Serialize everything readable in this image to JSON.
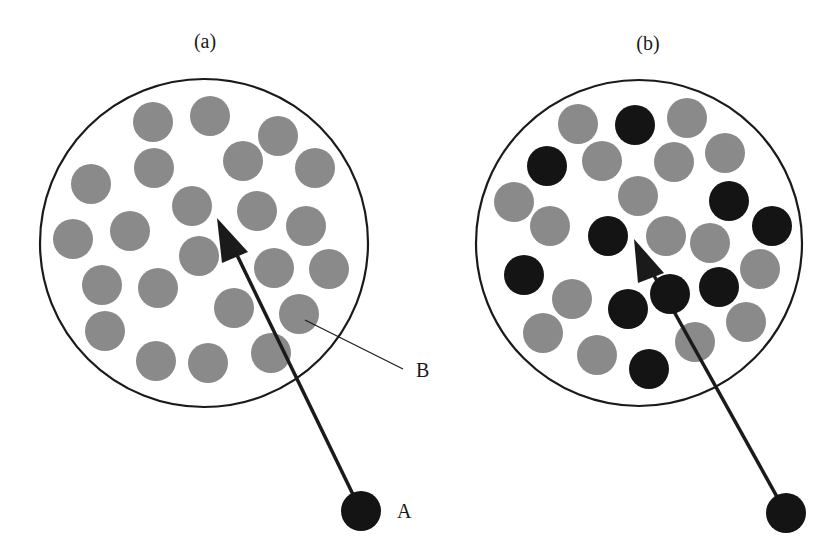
{
  "colors": {
    "background": "#ffffff",
    "outline": "#1a1a1a",
    "gray_particle": "#8a8a8a",
    "black_particle": "#141414",
    "arrow": "#1a1a1a"
  },
  "panels": [
    {
      "id": "a",
      "label": "(a)",
      "label_pos": [
        205,
        48
      ],
      "container": {
        "cx": 204,
        "cy": 243,
        "r": 164
      },
      "particle_radius": 20,
      "particles": [
        {
          "x": 153,
          "y": 122,
          "type": "gray"
        },
        {
          "x": 210,
          "y": 116,
          "type": "gray"
        },
        {
          "x": 278,
          "y": 136,
          "type": "gray"
        },
        {
          "x": 243,
          "y": 161,
          "type": "gray"
        },
        {
          "x": 315,
          "y": 168,
          "type": "gray"
        },
        {
          "x": 154,
          "y": 168,
          "type": "gray"
        },
        {
          "x": 91,
          "y": 184,
          "type": "gray"
        },
        {
          "x": 192,
          "y": 206,
          "type": "gray"
        },
        {
          "x": 257,
          "y": 211,
          "type": "gray"
        },
        {
          "x": 306,
          "y": 226,
          "type": "gray"
        },
        {
          "x": 73,
          "y": 239,
          "type": "gray"
        },
        {
          "x": 130,
          "y": 231,
          "type": "gray"
        },
        {
          "x": 199,
          "y": 256,
          "type": "gray"
        },
        {
          "x": 274,
          "y": 268,
          "type": "gray"
        },
        {
          "x": 329,
          "y": 269,
          "type": "gray"
        },
        {
          "x": 102,
          "y": 285,
          "type": "gray"
        },
        {
          "x": 158,
          "y": 288,
          "type": "gray"
        },
        {
          "x": 234,
          "y": 308,
          "type": "gray"
        },
        {
          "x": 299,
          "y": 314,
          "type": "gray"
        },
        {
          "x": 105,
          "y": 331,
          "type": "gray"
        },
        {
          "x": 156,
          "y": 361,
          "type": "gray"
        },
        {
          "x": 208,
          "y": 363,
          "type": "gray"
        },
        {
          "x": 271,
          "y": 353,
          "type": "gray"
        }
      ],
      "projectile": {
        "x": 361,
        "y": 511,
        "r": 20,
        "label": "A",
        "label_pos": [
          397,
          518
        ]
      },
      "arrow": {
        "shaft": [
          [
            361,
            511
          ],
          [
            236,
            253
          ]
        ],
        "head": [
          [
            217,
            218
          ],
          [
            248,
            252
          ],
          [
            222,
            263
          ]
        ]
      },
      "callout": {
        "label": "B",
        "line": [
          [
            305,
            320
          ],
          [
            403,
            369
          ]
        ],
        "label_pos": [
          416,
          377
        ]
      }
    },
    {
      "id": "b",
      "label": "(b)",
      "label_pos": [
        648,
        50
      ],
      "container": {
        "cx": 639,
        "cy": 243,
        "r": 163
      },
      "particle_radius": 20,
      "particles": [
        {
          "x": 578,
          "y": 124,
          "type": "gray"
        },
        {
          "x": 635,
          "y": 125,
          "type": "black"
        },
        {
          "x": 687,
          "y": 118,
          "type": "gray"
        },
        {
          "x": 547,
          "y": 166,
          "type": "black"
        },
        {
          "x": 602,
          "y": 161,
          "type": "gray"
        },
        {
          "x": 674,
          "y": 162,
          "type": "gray"
        },
        {
          "x": 725,
          "y": 153,
          "type": "gray"
        },
        {
          "x": 514,
          "y": 202,
          "type": "gray"
        },
        {
          "x": 638,
          "y": 196,
          "type": "gray"
        },
        {
          "x": 729,
          "y": 201,
          "type": "black"
        },
        {
          "x": 550,
          "y": 226,
          "type": "gray"
        },
        {
          "x": 608,
          "y": 236,
          "type": "black"
        },
        {
          "x": 666,
          "y": 236,
          "type": "gray"
        },
        {
          "x": 710,
          "y": 243,
          "type": "gray"
        },
        {
          "x": 772,
          "y": 226,
          "type": "black"
        },
        {
          "x": 524,
          "y": 275,
          "type": "black"
        },
        {
          "x": 572,
          "y": 299,
          "type": "gray"
        },
        {
          "x": 628,
          "y": 309,
          "type": "black"
        },
        {
          "x": 719,
          "y": 287,
          "type": "black"
        },
        {
          "x": 760,
          "y": 269,
          "type": "gray"
        },
        {
          "x": 543,
          "y": 333,
          "type": "gray"
        },
        {
          "x": 597,
          "y": 355,
          "type": "gray"
        },
        {
          "x": 649,
          "y": 369,
          "type": "black"
        },
        {
          "x": 695,
          "y": 342,
          "type": "gray"
        },
        {
          "x": 746,
          "y": 322,
          "type": "gray"
        }
      ],
      "overlay_particles": [
        {
          "x": 670,
          "y": 294,
          "type": "black"
        }
      ],
      "projectile": {
        "x": 786,
        "y": 513,
        "r": 20,
        "label": "",
        "label_pos": [
          0,
          0
        ]
      },
      "arrow": {
        "shaft": [
          [
            786,
            513
          ],
          [
            652,
            272
          ]
        ],
        "head": [
          [
            634,
            239
          ],
          [
            664,
            273
          ],
          [
            638,
            283
          ]
        ]
      },
      "callout": null
    }
  ]
}
